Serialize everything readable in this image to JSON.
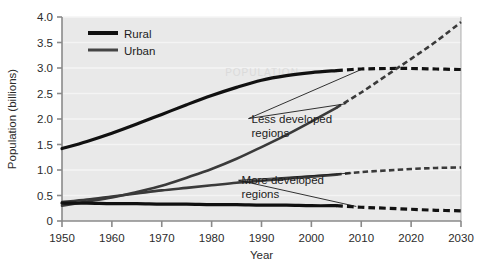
{
  "chart_data": {
    "type": "line",
    "title": "",
    "xlabel": "Year",
    "ylabel": "Population (billions)",
    "xlim": [
      1950,
      2030
    ],
    "ylim": [
      0,
      4.0
    ],
    "xticks": [
      "1950",
      "1960",
      "1970",
      "1980",
      "1990",
      "2000",
      "2010",
      "2020",
      "2030"
    ],
    "xtick_values": [
      1950,
      1960,
      1970,
      1980,
      1990,
      2000,
      2010,
      2020,
      2030
    ],
    "yticks": [
      "0",
      "0.5",
      "1.0",
      "1.5",
      "2.0",
      "2.5",
      "3.0",
      "3.5",
      "4.0"
    ],
    "ytick_values": [
      0,
      0.5,
      1.0,
      1.5,
      2.0,
      2.5,
      3.0,
      3.5,
      4.0
    ],
    "grid": true,
    "grid_axis": "y",
    "legend_position": "top-left",
    "projection_start_year": 2005,
    "projection_style": "dashed",
    "x": [
      1950,
      1955,
      1960,
      1965,
      1970,
      1975,
      1980,
      1985,
      1990,
      1995,
      2000,
      2005,
      2010,
      2015,
      2020,
      2025,
      2030
    ],
    "series": [
      {
        "name": "Rural",
        "region": "Less developed regions",
        "color": "#111111",
        "linewidth": 3.2,
        "values": [
          1.42,
          1.56,
          1.72,
          1.9,
          2.09,
          2.28,
          2.46,
          2.62,
          2.76,
          2.85,
          2.91,
          2.95,
          2.98,
          2.99,
          2.99,
          2.98,
          2.97
        ]
      },
      {
        "name": "Urban",
        "region": "Less developed regions",
        "color": "#3a3a3a",
        "linewidth": 2.6,
        "values": [
          0.3,
          0.38,
          0.46,
          0.57,
          0.69,
          0.85,
          1.02,
          1.22,
          1.45,
          1.69,
          1.95,
          2.22,
          2.52,
          2.85,
          3.18,
          3.52,
          3.9
        ]
      },
      {
        "name": "Urban",
        "region": "More developed regions",
        "color": "#3a3a3a",
        "linewidth": 2.6,
        "values": [
          0.37,
          0.42,
          0.48,
          0.54,
          0.6,
          0.65,
          0.7,
          0.75,
          0.79,
          0.83,
          0.87,
          0.91,
          0.96,
          0.99,
          1.02,
          1.04,
          1.05
        ]
      },
      {
        "name": "Rural",
        "region": "More developed regions",
        "color": "#111111",
        "linewidth": 3.2,
        "values": [
          0.35,
          0.35,
          0.34,
          0.34,
          0.33,
          0.33,
          0.32,
          0.32,
          0.31,
          0.31,
          0.3,
          0.3,
          0.27,
          0.25,
          0.23,
          0.21,
          0.2
        ]
      }
    ],
    "annotations": [
      {
        "text_line1": "Less developed",
        "text_line2": "regions",
        "x": 1988,
        "y": 1.93
      },
      {
        "text_line1": "More developed",
        "text_line2": "regions",
        "x": 1986,
        "y": 0.72
      }
    ]
  },
  "legend": {
    "items": [
      {
        "label": "Rural",
        "color": "#111111",
        "linewidth": 4
      },
      {
        "label": "Urban",
        "color": "#454545",
        "linewidth": 3
      }
    ]
  },
  "colors": {
    "plot_background": "#e9e9e9",
    "page_background": "#ffffff",
    "gridline": "#f4f4f4",
    "axis": "#8a8a8a",
    "text": "#2b2b2b"
  }
}
